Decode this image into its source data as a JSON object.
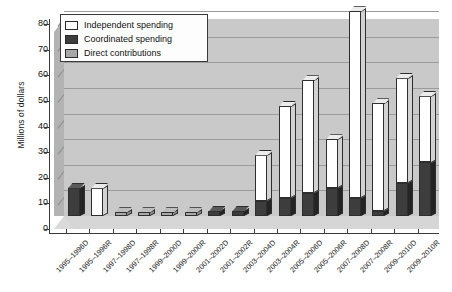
{
  "chart_data": {
    "type": "bar",
    "title": "",
    "subtitle": "",
    "xlabel": "",
    "ylabel": "Millions of dollars",
    "ylim": [
      0,
      80
    ],
    "yticks": [
      0,
      10,
      20,
      30,
      40,
      50,
      60,
      70,
      80
    ],
    "grid": true,
    "stacked": true,
    "legend_position": "top-left inside plot area",
    "legend": [
      "Independent spending",
      "Coordinated spending",
      "Direct contributions"
    ],
    "categories": [
      "1995–1996D",
      "1995–1996R",
      "1997–1998D",
      "1997–1998R",
      "1999–2000D",
      "1999–2000R",
      "2001–2002D",
      "2001–2002R",
      "2003–2004D",
      "2003–2004R",
      "2005–2006D",
      "2005–2006R",
      "2007–2008D",
      "2007–2008R",
      "2009–2010D",
      "2009–2010R"
    ],
    "series": [
      {
        "name": "Direct contributions",
        "color": "#a8a8a8",
        "values": [
          0,
          0,
          1.5,
          1.5,
          1.5,
          1.5,
          0,
          0,
          0,
          0,
          0,
          0,
          0,
          0,
          0,
          0
        ]
      },
      {
        "name": "Coordinated spending",
        "color": "#3d3d3d",
        "values": [
          11,
          0,
          0,
          0,
          0,
          0,
          2,
          2,
          6,
          7,
          9,
          11,
          7,
          2,
          13,
          21
        ]
      },
      {
        "name": "Independent spending",
        "color": "#ffffff",
        "values": [
          0,
          11,
          0,
          0,
          0,
          0,
          0,
          0,
          18,
          36,
          44,
          19,
          73,
          42,
          41,
          26
        ]
      }
    ],
    "totals": [
      11,
      11,
      1.5,
      1.5,
      1.5,
      1.5,
      2,
      2,
      24,
      43,
      53,
      30,
      80,
      44,
      54,
      47
    ]
  },
  "yaxis": {
    "title": "Millions of dollars",
    "ticks": [
      "0",
      "10",
      "20",
      "30",
      "40",
      "50",
      "60",
      "70",
      "80"
    ]
  },
  "legend": {
    "items": [
      {
        "label": "Independent spending",
        "swatch": "white"
      },
      {
        "label": "Coordinated spending",
        "swatch": "dark"
      },
      {
        "label": "Direct contributions",
        "swatch": "grey"
      }
    ]
  }
}
